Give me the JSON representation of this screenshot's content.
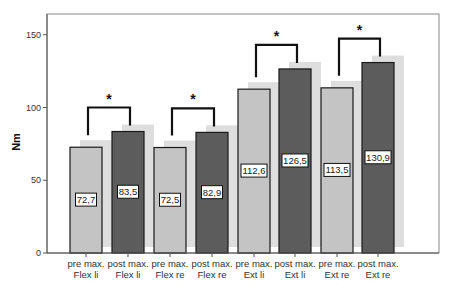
{
  "chart_data": {
    "type": "bar",
    "title": "",
    "xlabel": "",
    "ylabel": "Nm",
    "ylim": [
      0,
      165
    ],
    "yticks": [
      0,
      50,
      100,
      150
    ],
    "grid": false,
    "legend": null,
    "categories": [
      [
        "pre max.",
        "Flex li"
      ],
      [
        "post max.",
        "Flex li"
      ],
      [
        "pre max.",
        "Flex re"
      ],
      [
        "post max.",
        "Flex re"
      ],
      [
        "pre max.",
        "Ext li"
      ],
      [
        "post max.",
        "Ext li"
      ],
      [
        "pre max.",
        "Ext re"
      ],
      [
        "post max.",
        "Ext re"
      ]
    ],
    "values": [
      72.7,
      83.5,
      72.5,
      82.9,
      112.6,
      126.5,
      113.5,
      130.9
    ],
    "value_labels": [
      "72,7",
      "83,5",
      "72,5",
      "82,9",
      "112,6",
      "126,5",
      "113,5",
      "130,9"
    ],
    "bar_kinds": [
      "pre",
      "post",
      "pre",
      "post",
      "pre",
      "post",
      "pre",
      "post"
    ],
    "colors": {
      "pre": "#c4c4c4",
      "post": "#5c5c5c",
      "shadow": "#dedede",
      "outline": "#1a1a1a"
    },
    "significance": [
      {
        "from": 0,
        "to": 1,
        "label": "*"
      },
      {
        "from": 2,
        "to": 3,
        "label": "*"
      },
      {
        "from": 4,
        "to": 5,
        "label": "*"
      },
      {
        "from": 6,
        "to": 7,
        "label": "*"
      }
    ]
  }
}
